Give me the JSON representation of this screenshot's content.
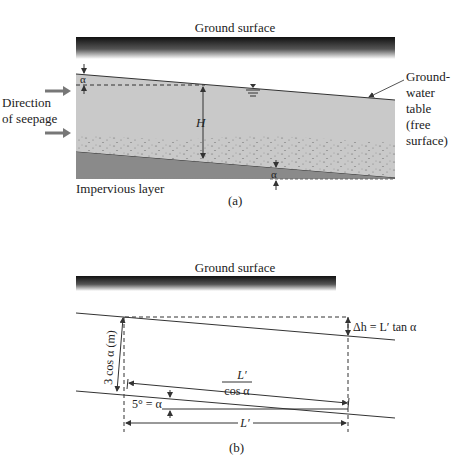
{
  "panel_a": {
    "ground_surface_label": "Ground surface",
    "seepage_label_line1": "Direction",
    "seepage_label_line2": "of seepage",
    "gw_label_lines": [
      "Ground-",
      "water",
      "table",
      "(free",
      "surface)"
    ],
    "height_label": "H",
    "alpha_top": "α",
    "alpha_bottom": "α",
    "impervious_label": "Impervious layer",
    "caption": "(a)"
  },
  "panel_b": {
    "ground_surface_label": "Ground surface",
    "delta_h_label": "Δh = L′ tan α",
    "thickness_label": "3 cos α (m)",
    "slope_length_num": "L′",
    "slope_length_den": "cos α",
    "angle_label": "5° = α",
    "horizontal_length_label": "L′",
    "caption": "(b)"
  },
  "colors": {
    "soil": "#c9c9c9",
    "impervious": "#8a8a8a",
    "line": "#333333",
    "arrow": "#777777"
  }
}
